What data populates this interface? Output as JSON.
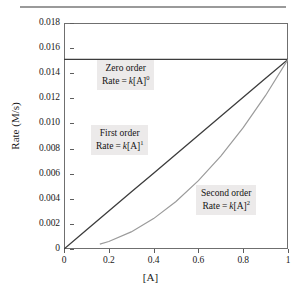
{
  "figure": {
    "top_rule": "horizontal-rule"
  },
  "chart_data": {
    "type": "line",
    "title": "",
    "subtitle": "",
    "xlabel": "[A]",
    "ylabel": "Rate (M/s)",
    "xlim": [
      0,
      1
    ],
    "ylim": [
      0,
      0.018
    ],
    "grid": false,
    "legend_position": "inline-annotations",
    "x_ticks": [
      "0",
      "0.2",
      "0.4",
      "0.6",
      "0.8",
      "1"
    ],
    "x_tick_values": [
      0,
      0.2,
      0.4,
      0.6,
      0.8,
      1
    ],
    "y_ticks": [
      "0",
      "0.002",
      "0.004",
      "0.006",
      "0.008",
      "0.010",
      "0.012",
      "0.014",
      "0.016",
      "0.018"
    ],
    "y_tick_values": [
      0,
      0.002,
      0.004,
      0.006,
      0.008,
      0.01,
      0.012,
      0.014,
      0.016,
      0.018
    ],
    "series": [
      {
        "name": "Zero order",
        "color": "#3c3c3c",
        "x": [
          0,
          0.1,
          0.2,
          0.3,
          0.4,
          0.5,
          0.6,
          0.7,
          0.8,
          0.9,
          1
        ],
        "values": [
          0.0151,
          0.0151,
          0.0151,
          0.0151,
          0.0151,
          0.0151,
          0.0151,
          0.0151,
          0.0151,
          0.0151,
          0.0151
        ]
      },
      {
        "name": "First order",
        "color": "#3c3c3c",
        "x": [
          0,
          0.1,
          0.2,
          0.3,
          0.4,
          0.5,
          0.6,
          0.7,
          0.8,
          0.9,
          1
        ],
        "values": [
          0,
          0.00151,
          0.00302,
          0.00453,
          0.00604,
          0.00755,
          0.00906,
          0.01057,
          0.01208,
          0.01359,
          0.0151
        ]
      },
      {
        "name": "Second order",
        "color": "#9b9b9b",
        "x": [
          0.16,
          0.2,
          0.3,
          0.4,
          0.5,
          0.6,
          0.7,
          0.8,
          0.9,
          1
        ],
        "values": [
          0.00039,
          0.0006,
          0.00136,
          0.00242,
          0.00378,
          0.00544,
          0.0074,
          0.00966,
          0.01223,
          0.0151
        ]
      }
    ],
    "annotations": [
      {
        "id": "zero-order",
        "line1": "Zero order",
        "rate_prefix": "Rate",
        "equals": "=",
        "k": "k",
        "bracket": "[A]",
        "exponent": "0"
      },
      {
        "id": "first-order",
        "line1": "First order",
        "rate_prefix": "Rate",
        "equals": "=",
        "k": "k",
        "bracket": "[A]",
        "exponent": "1"
      },
      {
        "id": "second-order",
        "line1": "Second order",
        "rate_prefix": "Rate",
        "equals": "=",
        "k": "k",
        "bracket": "[A]",
        "exponent": "2"
      }
    ]
  }
}
